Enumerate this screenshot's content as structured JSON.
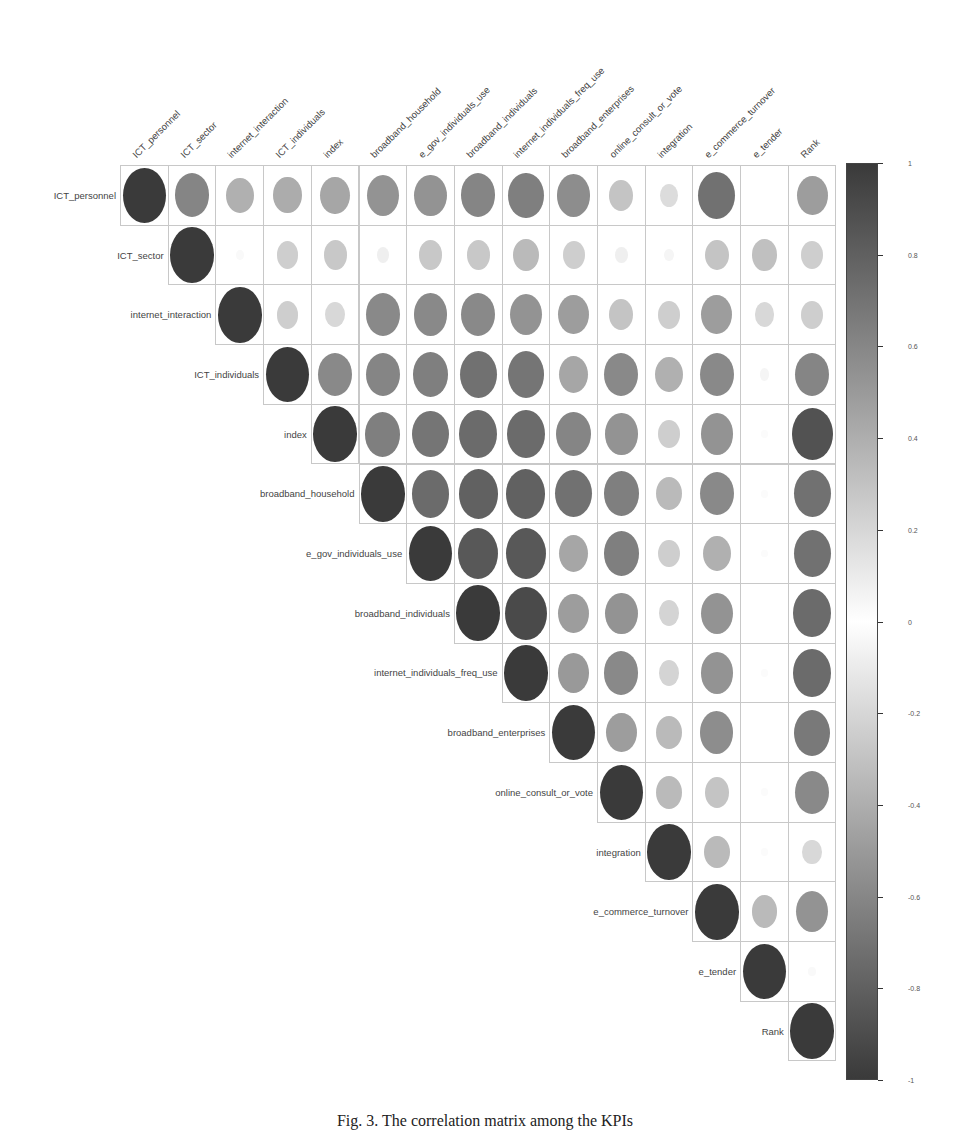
{
  "chart_data": {
    "type": "heatmap",
    "subtype": "correlation-circle-upper-triangle",
    "title": "",
    "xlabel": "",
    "ylabel": "",
    "variables": [
      "ICT_personnel",
      "ICT_sector",
      "internet_interaction",
      "ICT_individuals",
      "index",
      "broadband_household",
      "e_gov_individuals_use",
      "broadband_individuals",
      "internet_individuals_freq_use",
      "broadband_enterprises",
      "online_consult_or_vote",
      "integration",
      "e_commerce_turnover",
      "e_tender",
      "Rank"
    ],
    "col_labels": [
      "ICT_personnel",
      "ICT_sector",
      "internet_interaction",
      "ICT_individuals",
      "index",
      "broadband_household",
      "e_gov_individuals_use",
      "broadband_individuals",
      "internet_individuals_freq_use",
      "broadband_enterprises",
      "online_consult_or_vote",
      "integration",
      "e_commerce_turnover",
      "e_tender",
      "Rank"
    ],
    "row_labels": [
      "ICT_personnel",
      "ICT_sector",
      "internet_interaction",
      "ICT_individuals",
      "index",
      "broadband_household",
      "e_gov_individuals_use",
      "broadband_individuals",
      "internet_individuals_freq_use",
      "broadband_enterprises",
      "online_consult_or_vote",
      "integration",
      "e_commerce_turnover",
      "e_tender",
      "Rank"
    ],
    "matrix_upper": [
      [
        1.0,
        0.62,
        0.4,
        0.42,
        0.45,
        0.55,
        0.55,
        0.62,
        0.65,
        0.58,
        0.3,
        0.18,
        0.72,
        0.0,
        0.5
      ],
      [
        null,
        1.0,
        0.03,
        0.25,
        0.28,
        0.08,
        0.28,
        0.28,
        0.35,
        0.25,
        0.08,
        0.05,
        0.3,
        0.32,
        0.25
      ],
      [
        null,
        null,
        1.0,
        0.25,
        0.2,
        0.6,
        0.6,
        0.6,
        0.55,
        0.5,
        0.3,
        0.25,
        0.5,
        0.2,
        0.25
      ],
      [
        null,
        null,
        null,
        1.0,
        0.6,
        0.62,
        0.65,
        0.72,
        0.7,
        0.45,
        0.6,
        0.4,
        0.6,
        0.05,
        0.62
      ],
      [
        null,
        null,
        null,
        null,
        1.0,
        0.65,
        0.7,
        0.75,
        0.75,
        0.62,
        0.55,
        0.25,
        0.55,
        0.02,
        0.88
      ],
      [
        null,
        null,
        null,
        null,
        null,
        1.0,
        0.75,
        0.8,
        0.8,
        0.72,
        0.65,
        0.35,
        0.6,
        0.02,
        0.72
      ],
      [
        null,
        null,
        null,
        null,
        null,
        null,
        1.0,
        0.85,
        0.85,
        0.45,
        0.65,
        0.25,
        0.4,
        0.02,
        0.72
      ],
      [
        null,
        null,
        null,
        null,
        null,
        null,
        null,
        1.0,
        0.92,
        0.5,
        0.55,
        0.22,
        0.55,
        0.0,
        0.75
      ],
      [
        null,
        null,
        null,
        null,
        null,
        null,
        null,
        null,
        1.0,
        0.52,
        0.6,
        0.22,
        0.55,
        0.02,
        0.75
      ],
      [
        null,
        null,
        null,
        null,
        null,
        null,
        null,
        null,
        null,
        1.0,
        0.5,
        0.35,
        0.58,
        0.0,
        0.68
      ],
      [
        null,
        null,
        null,
        null,
        null,
        null,
        null,
        null,
        null,
        null,
        1.0,
        0.35,
        0.3,
        0.02,
        0.6
      ],
      [
        null,
        null,
        null,
        null,
        null,
        null,
        null,
        null,
        null,
        null,
        null,
        1.0,
        0.35,
        0.02,
        0.2
      ],
      [
        null,
        null,
        null,
        null,
        null,
        null,
        null,
        null,
        null,
        null,
        null,
        null,
        1.0,
        0.35,
        0.55
      ],
      [
        null,
        null,
        null,
        null,
        null,
        null,
        null,
        null,
        null,
        null,
        null,
        null,
        null,
        1.0,
        0.03
      ],
      [
        null,
        null,
        null,
        null,
        null,
        null,
        null,
        null,
        null,
        null,
        null,
        null,
        null,
        null,
        1.0
      ]
    ],
    "encoding": "circle size and grayscale darkness proportional to |r|",
    "colorbar": {
      "range": [
        -1,
        1
      ],
      "ticks": [
        "1",
        "0.8",
        "0.6",
        "0.4",
        "0.2",
        "0",
        "-0.2",
        "-0.4",
        "-0.6",
        "-0.8",
        "-1"
      ],
      "tick_values": [
        1,
        0.8,
        0.6,
        0.4,
        0.2,
        0,
        -0.2,
        -0.4,
        -0.6,
        -0.8,
        -1
      ],
      "position": "right",
      "color_extremes": "#3a3a3a",
      "color_zero": "#ffffff"
    },
    "grid": true,
    "legend": "colorbar right"
  },
  "caption": {
    "text": "Fig. 3. The correlation matrix among the KPIs",
    "visible_portion": "top half of text clipped at bottom edge"
  }
}
